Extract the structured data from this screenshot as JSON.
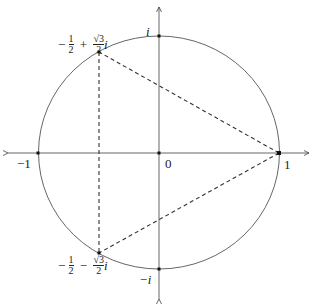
{
  "diagram": {
    "labels": {
      "origin": "0",
      "one": "1",
      "neg_one": "−1",
      "i": "i",
      "neg_i": "−i",
      "upper_root": "−1/2 + (√3/2) i",
      "lower_root": "−1/2 − (√3/2) i"
    },
    "points": [
      {
        "name": "1",
        "re": 1,
        "im": 0
      },
      {
        "name": "-1",
        "re": -1,
        "im": 0
      },
      {
        "name": "i",
        "re": 0,
        "im": 1
      },
      {
        "name": "-i",
        "re": 0,
        "im": -1
      },
      {
        "name": "0",
        "re": 0,
        "im": 0
      },
      {
        "name": "upper_root",
        "re": -0.5,
        "im": 0.866
      },
      {
        "name": "lower_root",
        "re": -0.5,
        "im": -0.866
      }
    ],
    "edges": [
      {
        "from": "1",
        "to": "upper_root",
        "style": "dashed"
      },
      {
        "from": "1",
        "to": "lower_root",
        "style": "dashed"
      },
      {
        "from": "upper_root",
        "to": "lower_root",
        "style": "dashed"
      }
    ],
    "colors": {
      "stroke": "#333333",
      "background": "#ffffff"
    }
  }
}
